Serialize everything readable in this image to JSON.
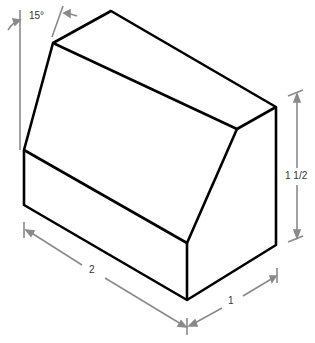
{
  "figure": {
    "type": "isometric block drawing",
    "labels": {
      "angle": "15°",
      "height": "1 1/2",
      "length": "2",
      "depth": "1"
    },
    "colors": {
      "outline": "#000000",
      "dimension": "#8a8a8a",
      "background": "#ffffff"
    }
  }
}
